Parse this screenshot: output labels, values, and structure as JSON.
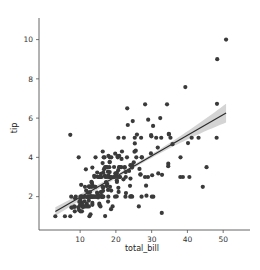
{
  "chart_data": {
    "type": "scatter",
    "title": "",
    "xlabel": "total_bill",
    "ylabel": "tip",
    "xlim": [
      -1.5,
      57.5
    ],
    "ylim": [
      0.3,
      11.1
    ],
    "xticks": [
      10,
      20,
      30,
      40,
      50
    ],
    "yticks": [
      2,
      4,
      6,
      8,
      10
    ],
    "xtick_labels": [
      "10",
      "20",
      "30",
      "40",
      "50"
    ],
    "ytick_labels": [
      "2",
      "4",
      "6",
      "8",
      "10"
    ],
    "grid": false,
    "legend": "none",
    "marker_color": "#3a3a3a",
    "line_color": "#2b2b2b",
    "band_color": "#b0b0b0",
    "background_color": "#ffffff",
    "regression": {
      "type": "linear",
      "slope": 0.105,
      "intercept": 0.92,
      "ci": 95,
      "x_start": 3.07,
      "x_end": 50.81,
      "y_start": 1.24,
      "y_end": 6.26,
      "band_halfwidth_start": 0.22,
      "band_halfwidth_end": 0.48,
      "band_halfwidth_mid": 0.09
    },
    "x": [
      16.99,
      10.34,
      21.01,
      23.68,
      24.59,
      25.29,
      8.77,
      26.88,
      15.04,
      14.78,
      10.27,
      35.26,
      15.42,
      18.43,
      14.83,
      21.58,
      10.33,
      16.29,
      16.97,
      20.65,
      17.92,
      20.29,
      15.77,
      39.42,
      19.82,
      17.81,
      13.37,
      12.69,
      21.7,
      19.65,
      9.55,
      18.35,
      15.06,
      20.69,
      17.78,
      24.06,
      16.31,
      16.93,
      18.69,
      31.27,
      16.04,
      17.46,
      13.94,
      9.68,
      30.4,
      18.29,
      22.23,
      32.4,
      28.55,
      18.04,
      12.54,
      10.29,
      34.81,
      9.94,
      25.56,
      19.49,
      38.01,
      26.41,
      11.24,
      48.27,
      20.29,
      13.81,
      11.02,
      18.29,
      17.59,
      20.08,
      16.45,
      3.07,
      20.23,
      15.01,
      12.02,
      17.07,
      26.86,
      25.28,
      14.73,
      10.51,
      17.92,
      27.2,
      22.76,
      17.29,
      19.44,
      16.66,
      10.07,
      32.68,
      15.98,
      34.83,
      13.03,
      18.28,
      24.71,
      21.16,
      28.97,
      22.49,
      5.75,
      16.32,
      22.75,
      40.17,
      27.28,
      12.03,
      21.01,
      12.46,
      11.35,
      15.38,
      44.3,
      22.42,
      20.92,
      15.36,
      20.49,
      25.21,
      18.24,
      14.31,
      14.0,
      7.25,
      38.07,
      23.95,
      25.71,
      17.31,
      29.93,
      10.65,
      12.43,
      24.08,
      11.69,
      13.42,
      14.26,
      15.95,
      12.48,
      29.8,
      8.52,
      14.52,
      11.38,
      22.82,
      19.08,
      20.27,
      11.17,
      12.26,
      18.26,
      8.51,
      10.33,
      14.15,
      16.0,
      13.16,
      17.47,
      34.3,
      41.19,
      27.05,
      16.43,
      8.35,
      18.64,
      11.87,
      9.78,
      7.51,
      14.07,
      13.13,
      17.26,
      24.55,
      19.77,
      29.85,
      48.17,
      25.0,
      13.39,
      16.49,
      21.5,
      12.66,
      16.21,
      13.81,
      17.51,
      24.52,
      20.76,
      31.71,
      10.59,
      10.63,
      50.81,
      15.81,
      7.25,
      31.85,
      16.82,
      32.9,
      17.89,
      14.48,
      9.6,
      34.63,
      34.65,
      23.33,
      45.35,
      23.17,
      40.55,
      20.69,
      20.9,
      30.46,
      18.15,
      23.1,
      15.69,
      19.81,
      28.44,
      15.48,
      16.58,
      7.56,
      10.34,
      43.11,
      13.0,
      13.51,
      18.71,
      12.74,
      13.0,
      16.4,
      20.53,
      16.47,
      26.59,
      38.73,
      24.27,
      12.76,
      30.06,
      25.89,
      48.33,
      13.27,
      28.17,
      12.9,
      28.15,
      11.59,
      7.74,
      30.14,
      12.16,
      13.42,
      8.58,
      15.98,
      13.42,
      16.27,
      10.09,
      20.45,
      13.28,
      22.12,
      24.01,
      15.69,
      11.61,
      10.77,
      15.53,
      10.07,
      12.6,
      32.83,
      35.83,
      29.03,
      27.18,
      22.67,
      17.82,
      18.78
    ],
    "y": [
      1.01,
      1.66,
      3.5,
      3.31,
      3.61,
      4.71,
      2.0,
      3.12,
      1.96,
      3.23,
      1.71,
      5.0,
      1.57,
      3.0,
      3.02,
      3.92,
      1.67,
      3.71,
      3.5,
      3.35,
      4.08,
      2.75,
      2.23,
      7.58,
      3.18,
      2.34,
      2.0,
      2.0,
      4.3,
      3.0,
      1.45,
      2.5,
      3.0,
      2.45,
      3.27,
      3.6,
      2.0,
      3.07,
      2.31,
      5.0,
      2.24,
      2.54,
      3.06,
      1.32,
      5.6,
      3.0,
      5.0,
      6.0,
      2.05,
      3.0,
      2.5,
      2.6,
      5.2,
      1.56,
      4.34,
      3.51,
      3.0,
      1.5,
      1.76,
      6.73,
      3.21,
      2.0,
      1.98,
      3.76,
      2.64,
      3.15,
      2.47,
      1.0,
      2.01,
      2.09,
      1.97,
      3.0,
      3.14,
      5.0,
      2.2,
      1.25,
      3.08,
      4.0,
      3.0,
      2.71,
      3.0,
      3.4,
      1.83,
      5.0,
      2.03,
      5.17,
      2.0,
      4.0,
      5.85,
      3.0,
      3.0,
      3.5,
      1.0,
      4.3,
      3.25,
      4.73,
      4.0,
      1.5,
      3.0,
      1.5,
      2.5,
      3.0,
      2.5,
      3.48,
      4.08,
      1.64,
      4.06,
      4.29,
      3.76,
      4.0,
      3.0,
      1.0,
      4.0,
      2.55,
      4.0,
      3.5,
      5.07,
      1.5,
      1.8,
      2.92,
      2.31,
      1.68,
      2.5,
      2.0,
      2.52,
      4.2,
      1.48,
      2.0,
      2.0,
      2.18,
      1.5,
      2.83,
      1.5,
      2.0,
      3.25,
      1.25,
      2.0,
      2.0,
      2.0,
      2.75,
      3.5,
      6.7,
      5.0,
      5.0,
      2.3,
      1.5,
      1.36,
      1.63,
      1.73,
      2.0,
      2.5,
      2.0,
      2.74,
      2.0,
      2.0,
      5.14,
      5.0,
      3.75,
      2.61,
      2.0,
      3.5,
      2.5,
      2.0,
      2.0,
      3.0,
      3.48,
      2.24,
      4.5,
      1.61,
      2.0,
      10.0,
      3.16,
      5.15,
      3.18,
      4.0,
      3.11,
      2.0,
      2.0,
      4.0,
      3.55,
      3.68,
      5.65,
      3.5,
      6.5,
      3.0,
      5.0,
      3.5,
      2.0,
      3.5,
      4.0,
      1.5,
      4.19,
      2.56,
      2.02,
      4.0,
      1.44,
      2.0,
      5.0,
      2.0,
      2.0,
      4.0,
      2.01,
      2.0,
      2.5,
      4.0,
      3.23,
      3.41,
      3.0,
      2.03,
      2.23,
      2.0,
      5.16,
      9.0,
      2.5,
      6.7,
      1.1,
      3.0,
      1.5,
      1.44,
      3.09,
      2.2,
      3.48,
      1.92,
      3.0,
      1.58,
      2.5,
      2.0,
      3.0,
      2.72,
      2.88,
      2.0,
      3.0,
      3.39,
      1.47,
      3.0,
      1.25,
      1.0,
      1.17,
      4.67,
      5.92,
      2.0,
      2.0,
      1.75,
      3.0
    ]
  },
  "axis": {
    "xlabel": "total_bill",
    "ylabel": "tip"
  }
}
